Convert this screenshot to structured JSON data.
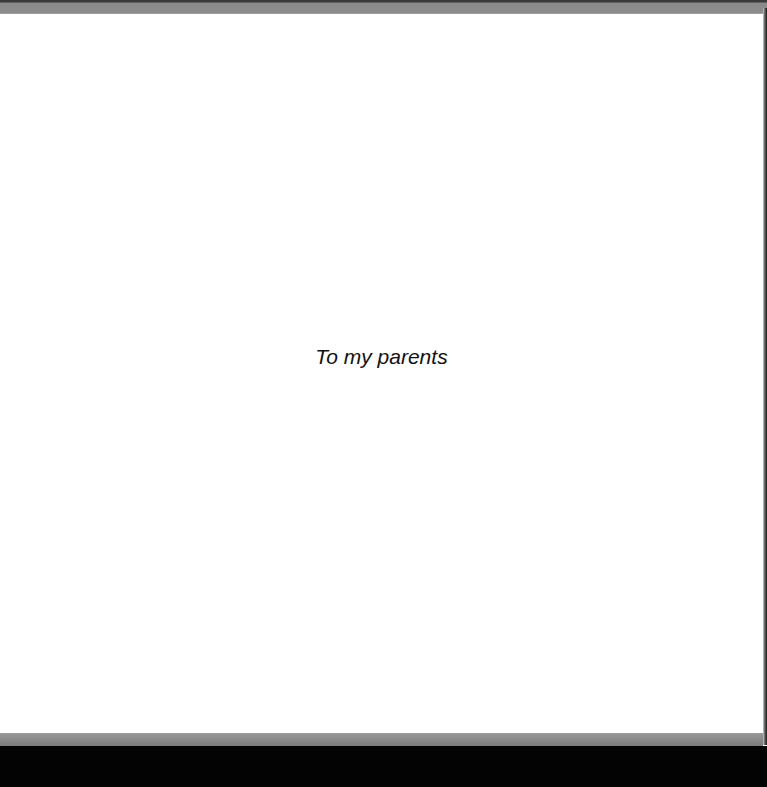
{
  "page": {
    "dedication": "To my parents"
  },
  "colors": {
    "page_background": "#ffffff",
    "text": "#111111",
    "top_band": "#8c8c8c",
    "bottom_band": "#8a8a8a",
    "bottom_bar": "#030303"
  }
}
